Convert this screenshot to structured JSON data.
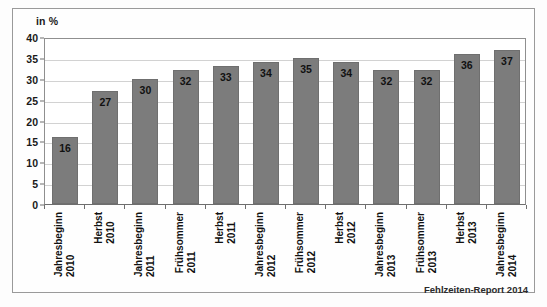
{
  "chart_data": {
    "type": "bar",
    "title": "",
    "subtitle": "",
    "axis_unit_label": "in %",
    "xlabel": "",
    "ylabel": "",
    "ylim": [
      0,
      40
    ],
    "ytick_step": 5,
    "yticks": [
      40,
      35,
      30,
      25,
      20,
      15,
      10,
      5,
      0
    ],
    "grid": true,
    "legend": false,
    "legend_position": "none",
    "bar_color": "#7c7c7c",
    "categories": [
      "Jahresbeginn 2010",
      "Herbst 2010",
      "Jahresbeginn 2011",
      "Frühsommer 2011",
      "Herbst 2011",
      "Jahresbeginn 2012",
      "Frühsommer 2012",
      "Herbst 2012",
      "Jahresbeginn 2013",
      "Frühsommer 2013",
      "Herbst 2013",
      "Jahresbeginn 2014"
    ],
    "category_lines": [
      [
        "Jahresbeginn",
        "2010"
      ],
      [
        "Herbst",
        "2010"
      ],
      [
        "Jahresbeginn",
        "2011"
      ],
      [
        "Frühsommer",
        "2011"
      ],
      [
        "Herbst",
        "2011"
      ],
      [
        "Jahresbeginn",
        "2012"
      ],
      [
        "Frühsommer",
        "2012"
      ],
      [
        "Herbst",
        "2012"
      ],
      [
        "Jahresbeginn",
        "2013"
      ],
      [
        "Frühsommer",
        "2013"
      ],
      [
        "Herbst",
        "2013"
      ],
      [
        "Jahresbeginn",
        "2014"
      ]
    ],
    "values": [
      16,
      27,
      30,
      32,
      33,
      34,
      35,
      34,
      32,
      32,
      36,
      37
    ],
    "value_labels": [
      "16",
      "27",
      "30",
      "32",
      "33",
      "34",
      "35",
      "34",
      "32",
      "32",
      "36",
      "37"
    ]
  },
  "source": {
    "note": "Fehlzeiten-Report 2014"
  }
}
